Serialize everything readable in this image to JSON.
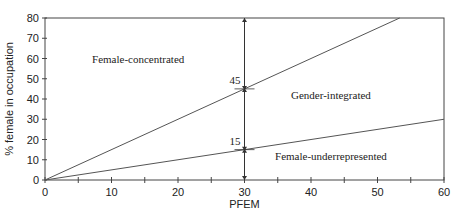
{
  "chart_data": {
    "type": "line",
    "title": "",
    "xlabel": "PFEM",
    "ylabel": "% female in occupation",
    "xlim": [
      0,
      60
    ],
    "ylim": [
      0,
      80
    ],
    "xticks": [
      0,
      10,
      20,
      30,
      40,
      50,
      60
    ],
    "yticks": [
      0,
      10,
      20,
      30,
      40,
      50,
      60,
      70,
      80
    ],
    "grid": false,
    "legend": "none",
    "series": [
      {
        "name": "upper threshold (1.5 × PFEM)",
        "x": [
          0,
          53.33
        ],
        "y": [
          0,
          80
        ],
        "color": "#555555"
      },
      {
        "name": "lower threshold (0.5 × PFEM)",
        "x": [
          0,
          60
        ],
        "y": [
          0,
          30
        ],
        "color": "#555555"
      }
    ],
    "reference_line": {
      "x": 30,
      "y_range": [
        0,
        80
      ],
      "arrow_points": [
        45,
        15
      ],
      "color": "#333333"
    },
    "annotations": [
      {
        "text": "45",
        "x": 30,
        "y": 45,
        "role": "upper-threshold-value"
      },
      {
        "text": "15",
        "x": 30,
        "y": 15,
        "role": "lower-threshold-value"
      },
      {
        "text": "Female-concentrated",
        "x": 9.5,
        "y": 60,
        "role": "region"
      },
      {
        "text": "Gender-integrated",
        "x": 43,
        "y": 40,
        "role": "region"
      },
      {
        "text": "Female-underrepresented",
        "x": 43,
        "y": 10,
        "role": "region"
      }
    ]
  }
}
